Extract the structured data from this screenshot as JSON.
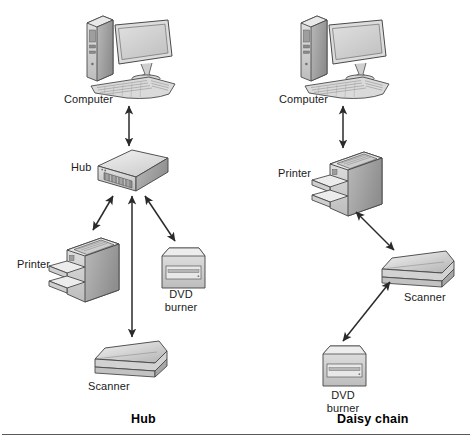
{
  "figure": {
    "background": "#ffffff",
    "divider_color": "#59595b"
  },
  "panels": [
    {
      "id": "hub",
      "caption": "Hub",
      "caption_pos": {
        "x": 131,
        "y": 415
      },
      "nodes": [
        {
          "id": "computer",
          "label": "Computer",
          "label_pos": {
            "x": 64,
            "y": 93
          },
          "icon": "desktop-computer-icon",
          "icon_pos": {
            "x": 83,
            "y": 14
          }
        },
        {
          "id": "hub",
          "label": "Hub",
          "label_pos": {
            "x": 71,
            "y": 161
          },
          "icon": "network-hub-icon",
          "icon_pos": {
            "x": 96,
            "y": 148
          }
        },
        {
          "id": "printer",
          "label": "Printer",
          "label_pos": {
            "x": 17,
            "y": 258
          },
          "icon": "printer-icon",
          "icon_pos": {
            "x": 49,
            "y": 232
          }
        },
        {
          "id": "dvd",
          "label": "DVD\nburner",
          "label_line1": "DVD",
          "label_line2": "burner",
          "label_pos": {
            "x": 162,
            "y": 288
          },
          "icon": "dvd-burner-icon",
          "icon_pos": {
            "x": 159,
            "y": 246
          }
        },
        {
          "id": "scanner",
          "label": "Scanner",
          "label_pos": {
            "x": 88,
            "y": 380
          },
          "icon": "scanner-icon",
          "icon_pos": {
            "x": 93,
            "y": 339
          }
        }
      ],
      "connections": [
        {
          "from": "computer",
          "to": "hub",
          "style": "double-arrow"
        },
        {
          "from": "hub",
          "to": "printer",
          "style": "double-arrow"
        },
        {
          "from": "hub",
          "to": "dvd",
          "style": "double-arrow"
        },
        {
          "from": "hub",
          "to": "scanner",
          "style": "double-arrow"
        }
      ]
    },
    {
      "id": "daisy-chain",
      "caption": "Daisy chain",
      "caption_pos": {
        "x": 337,
        "y": 415
      },
      "nodes": [
        {
          "id": "computer",
          "label": "Computer",
          "label_pos": {
            "x": 279,
            "y": 93
          },
          "icon": "desktop-computer-icon",
          "icon_pos": {
            "x": 297,
            "y": 14
          }
        },
        {
          "id": "printer",
          "label": "Printer",
          "label_pos": {
            "x": 278,
            "y": 167
          },
          "icon": "printer-icon",
          "icon_pos": {
            "x": 312,
            "y": 146
          }
        },
        {
          "id": "scanner",
          "label": "Scanner",
          "label_pos": {
            "x": 404,
            "y": 291
          },
          "icon": "scanner-icon",
          "icon_pos": {
            "x": 380,
            "y": 249
          }
        },
        {
          "id": "dvd",
          "label": "DVD\nburner",
          "label_line1": "DVD",
          "label_line2": "burner",
          "label_pos": {
            "x": 319,
            "y": 389
          },
          "icon": "dvd-burner-icon",
          "icon_pos": {
            "x": 320,
            "y": 344
          }
        }
      ],
      "connections": [
        {
          "from": "computer",
          "to": "printer",
          "style": "double-arrow"
        },
        {
          "from": "printer",
          "to": "scanner",
          "style": "double-arrow"
        },
        {
          "from": "scanner",
          "to": "dvd",
          "style": "double-arrow"
        }
      ]
    }
  ],
  "labels": {
    "computer_left": "Computer",
    "hub_left": "Hub",
    "printer_left": "Printer",
    "dvd_left_line1": "DVD",
    "dvd_left_line2": "burner",
    "scanner_left": "Scanner",
    "computer_right": "Computer",
    "printer_right": "Printer",
    "scanner_right": "Scanner",
    "dvd_right_line1": "DVD",
    "dvd_right_line2": "burner",
    "caption_left": "Hub",
    "caption_right": "Daisy chain"
  },
  "palette": {
    "outline": "#4a4a4a",
    "light_gray": "#e8e8e8",
    "mid_gray": "#c9c9c9",
    "dark_gray": "#9a9a9a",
    "deep_gray": "#6f6f6f",
    "arrow": "#2a2a2a",
    "screen": "#d6d6d6",
    "text": "#1a1a1a"
  }
}
